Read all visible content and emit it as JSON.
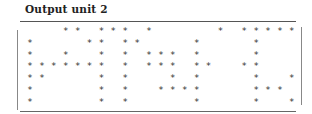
{
  "title": "Output unit 2",
  "output": {
    "columns": 23,
    "rows": [
      "   ** *** *     * *****",
      "*    ** **    *    *   ",
      "*  *  * * *** *    *   ",
      "******* * *** **  **   ",
      "**    * *   * *    *  *",
      "*     * *  ****    *** ",
      "*     * *     *    *  *"
    ]
  }
}
